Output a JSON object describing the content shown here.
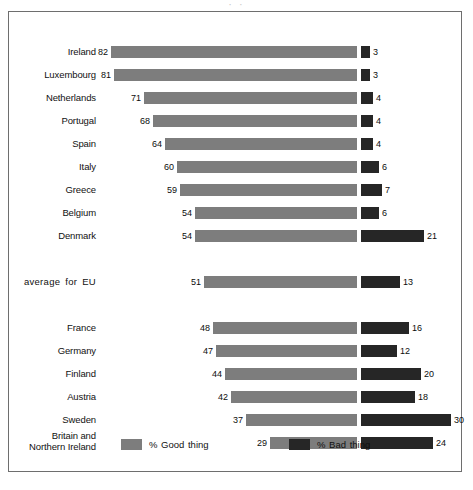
{
  "title_remnant": "·      ·",
  "colors": {
    "good": "#7d7d7d",
    "bad": "#262626",
    "frame": "#6e6e6e",
    "text": "#111111",
    "background": "#ffffff"
  },
  "legend": {
    "good": {
      "label": "% Good thing",
      "swatch": "good-thing-swatch"
    },
    "bad": {
      "label": "% Bad thing",
      "swatch": "bad-thing-swatch"
    }
  },
  "chart_data": {
    "type": "bar",
    "title": "",
    "subtitle": "",
    "xlabel": "",
    "ylabel": "",
    "orientation": "horizontal",
    "layout": "diverging",
    "grid": false,
    "legend_position": "bottom",
    "baseline_x_px": 348,
    "px_per_unit": 3.0,
    "series": [
      {
        "name": "% Good thing",
        "color": "#7d7d7d",
        "direction": "left",
        "values": [
          82,
          81,
          71,
          68,
          64,
          60,
          59,
          54,
          54,
          51,
          48,
          47,
          44,
          42,
          37,
          29
        ]
      },
      {
        "name": "% Bad thing",
        "color": "#262626",
        "direction": "right",
        "values": [
          3,
          3,
          4,
          4,
          4,
          6,
          7,
          6,
          21,
          13,
          16,
          12,
          20,
          18,
          30,
          24
        ]
      }
    ],
    "categories": [
      "Ireland",
      "Luxembourg",
      "Netherlands",
      "Portugal",
      "Spain",
      "Italy",
      "Greece",
      "Belgium",
      "Denmark",
      "average for EU",
      "France",
      "Germany",
      "Finland",
      "Austria",
      "Sweden",
      "Britain and\nNorthern Ireland"
    ],
    "rows": [
      {
        "label": "Ireland",
        "good": 82,
        "bad": 3,
        "y": 33,
        "two_line": false,
        "is_eu": false
      },
      {
        "label": "Luxembourg",
        "good": 81,
        "bad": 3,
        "y": 56,
        "two_line": false,
        "is_eu": false
      },
      {
        "label": "Netherlands",
        "good": 71,
        "bad": 4,
        "y": 79,
        "two_line": false,
        "is_eu": false
      },
      {
        "label": "Portugal",
        "good": 68,
        "bad": 4,
        "y": 102,
        "two_line": false,
        "is_eu": false
      },
      {
        "label": "Spain",
        "good": 64,
        "bad": 4,
        "y": 125,
        "two_line": false,
        "is_eu": false
      },
      {
        "label": "Italy",
        "good": 60,
        "bad": 6,
        "y": 148,
        "two_line": false,
        "is_eu": false
      },
      {
        "label": "Greece",
        "good": 59,
        "bad": 7,
        "y": 171,
        "two_line": false,
        "is_eu": false
      },
      {
        "label": "Belgium",
        "good": 54,
        "bad": 6,
        "y": 194,
        "two_line": false,
        "is_eu": false
      },
      {
        "label": "Denmark",
        "good": 54,
        "bad": 21,
        "y": 217,
        "two_line": false,
        "is_eu": false
      },
      {
        "label": "average for EU",
        "good": 51,
        "bad": 13,
        "y": 263,
        "two_line": false,
        "is_eu": true
      },
      {
        "label": "France",
        "good": 48,
        "bad": 16,
        "y": 309,
        "two_line": false,
        "is_eu": false
      },
      {
        "label": "Germany",
        "good": 47,
        "bad": 12,
        "y": 332,
        "two_line": false,
        "is_eu": false
      },
      {
        "label": "Finland",
        "good": 44,
        "bad": 20,
        "y": 355,
        "two_line": false,
        "is_eu": false
      },
      {
        "label": "Austria",
        "good": 42,
        "bad": 18,
        "y": 378,
        "two_line": false,
        "is_eu": false
      },
      {
        "label": "Sweden",
        "good": 37,
        "bad": 30,
        "y": 401,
        "two_line": false,
        "is_eu": false
      },
      {
        "label": "Britain and\nNorthern Ireland",
        "good": 29,
        "bad": 24,
        "y": 424,
        "two_line": true,
        "is_eu": false
      }
    ]
  }
}
